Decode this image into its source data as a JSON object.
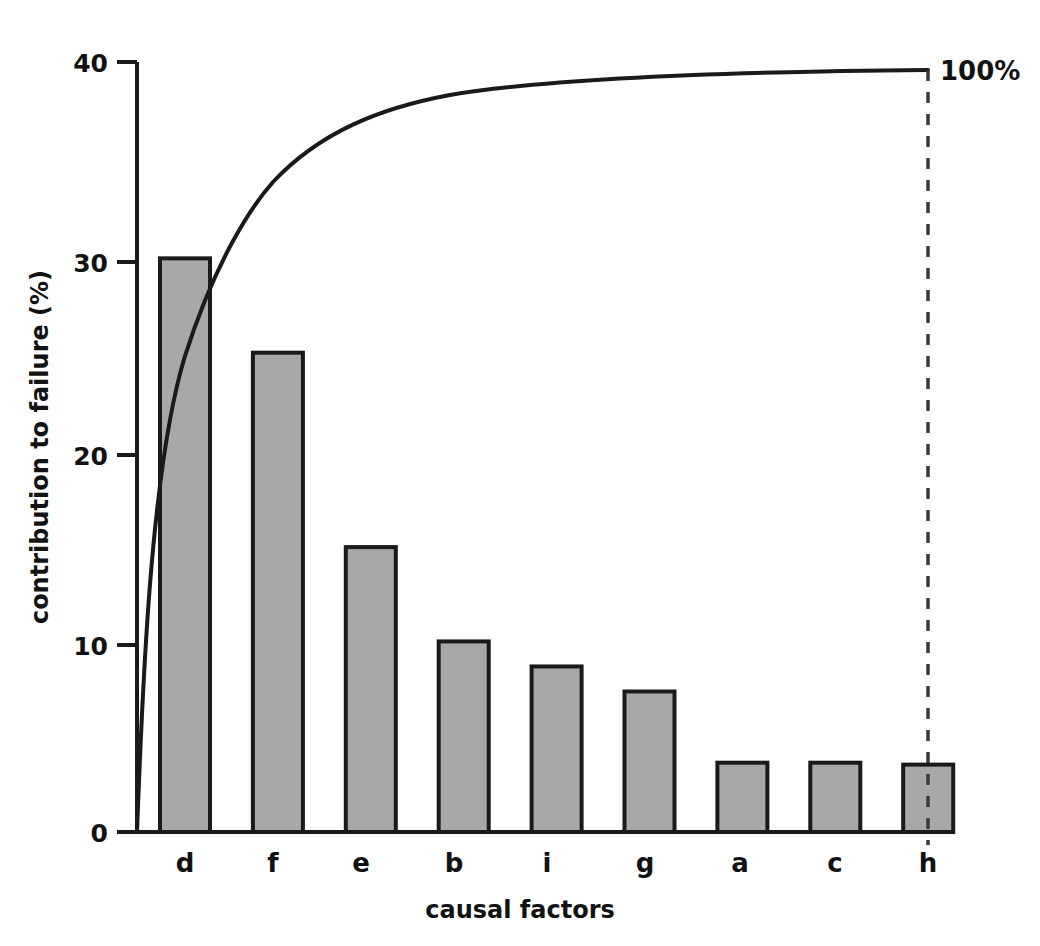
{
  "chart_data": {
    "type": "bar",
    "title": "",
    "subtitle": "",
    "xlabel": "causal factors",
    "ylabel": "contribution to failure (%)",
    "categories": [
      "d",
      "f",
      "e",
      "b",
      "i",
      "g",
      "a",
      "c",
      "h"
    ],
    "values": [
      29.8,
      24.9,
      14.8,
      9.9,
      8.6,
      7.3,
      3.6,
      3.6,
      3.5
    ],
    "ylim": [
      0,
      40
    ],
    "yticks": [
      0,
      10,
      20,
      30,
      40
    ],
    "ytick_labels": [
      "0",
      "10",
      "20",
      "30",
      "40"
    ],
    "grid": false,
    "legend": "none",
    "series": [
      {
        "name": "contribution to failure (%)",
        "type": "bar",
        "values": [
          29.8,
          24.9,
          14.8,
          9.9,
          8.6,
          7.3,
          3.6,
          3.6,
          3.5
        ]
      },
      {
        "name": "cumulative percentage",
        "type": "line",
        "values": [
          29.8,
          54.7,
          69.5,
          79.4,
          88.0,
          95.3,
          98.9,
          102.5,
          106.0
        ],
        "normalized_cumulative": [
          28.1,
          51.6,
          65.6,
          74.9,
          83.0,
          89.9,
          93.3,
          96.7,
          100.0
        ]
      }
    ],
    "annotations": [
      {
        "text": "100%",
        "x_category": "h",
        "value": 100
      }
    ]
  },
  "axes": {
    "y_axis_label": "contribution to failure (%)",
    "x_axis_label": "causal factors",
    "y_tick_labels": [
      "40",
      "30",
      "20",
      "10",
      "0"
    ],
    "x_tick_labels": [
      "d",
      "f",
      "e",
      "b",
      "i",
      "g",
      "a",
      "c",
      "h"
    ]
  },
  "annotation": {
    "cumulative_end_label": "100%"
  },
  "colors": {
    "bar_fill": "#a8a8a8",
    "bar_stroke": "#1a1a1a",
    "axis": "#1a1a1a",
    "curve": "#1a1a1a",
    "dashed_line": "#3a3a3a",
    "background": "#ffffff",
    "text": "#121212"
  }
}
